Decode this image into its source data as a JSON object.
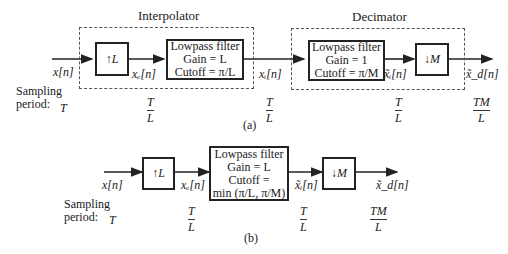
{
  "part_a": {
    "caption": "(a)",
    "interpolator": {
      "title": "Interpolator",
      "upsampler": {
        "arrow": "↑",
        "factor": "L"
      },
      "filter": {
        "line1": "Lowpass filter",
        "line2": "Gain = L",
        "line3": "Cutoff = π/L"
      }
    },
    "decimator": {
      "title": "Decimator",
      "filter": {
        "line1": "Lowpass filter",
        "line2": "Gain = 1",
        "line3": "Cutoff = π/M"
      },
      "downsampler": {
        "arrow": "↓",
        "factor": "M"
      }
    },
    "signals": {
      "input": "x[n]",
      "expanded": "xₑ[n]",
      "interpolated": "xᵢ[n]",
      "filtered": "x̃ᵢ[n]",
      "output": "x̃_d[n]"
    },
    "sampling_label_1": "Sampling",
    "sampling_label_2": "period:",
    "periods": {
      "input": "T",
      "expanded": {
        "num": "T",
        "den": "L"
      },
      "interpolated": {
        "num": "T",
        "den": "L"
      },
      "filtered": {
        "num": "T",
        "den": "L"
      },
      "output": {
        "num": "TM",
        "den": "L"
      }
    }
  },
  "part_b": {
    "caption": "(b)",
    "upsampler": {
      "arrow": "↑",
      "factor": "L"
    },
    "filter": {
      "line1": "Lowpass filter",
      "line2": "Gain = L",
      "line3": "Cutoff =",
      "line4": "min (π/L, π/M)"
    },
    "downsampler": {
      "arrow": "↓",
      "factor": "M"
    },
    "signals": {
      "input": "x[n]",
      "expanded": "xₑ[n]",
      "filtered": "x̃ᵢ[n]",
      "output": "x̃_d[n]"
    },
    "sampling_label_1": "Sampling",
    "sampling_label_2": "period:",
    "periods": {
      "input": "T",
      "expanded": {
        "num": "T",
        "den": "L"
      },
      "filtered": {
        "num": "T",
        "den": "L"
      },
      "output": {
        "num": "TM",
        "den": "L"
      }
    }
  }
}
